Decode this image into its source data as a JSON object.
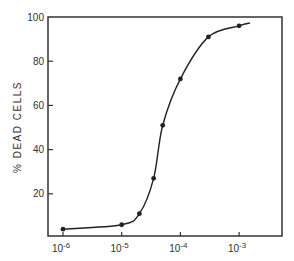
{
  "chart_data": {
    "type": "line",
    "title": "",
    "xlabel": "",
    "ylabel": "% DEAD CELLS",
    "xscale": "log",
    "xlim": [
      5e-07,
      0.003
    ],
    "ylim": [
      0,
      100
    ],
    "grid": false,
    "legend": null,
    "x_ticks": [
      {
        "value": 1e-06,
        "base": "10",
        "exp": "-6"
      },
      {
        "value": 1e-05,
        "base": "10",
        "exp": "-5"
      },
      {
        "value": 0.0001,
        "base": "10",
        "exp": "-4"
      },
      {
        "value": 0.001,
        "base": "10",
        "exp": "-3"
      }
    ],
    "y_ticks": [
      20,
      40,
      60,
      80,
      100
    ],
    "series": [
      {
        "name": "% dead cells",
        "marker": "circle",
        "x": [
          1e-06,
          1e-05,
          2e-05,
          3.5e-05,
          5e-05,
          0.0001,
          0.0003,
          0.001
        ],
        "y": [
          4,
          6,
          11,
          27,
          51,
          72,
          91,
          96
        ]
      }
    ]
  },
  "colors": {
    "line": "#222222",
    "axis": "#333333"
  }
}
